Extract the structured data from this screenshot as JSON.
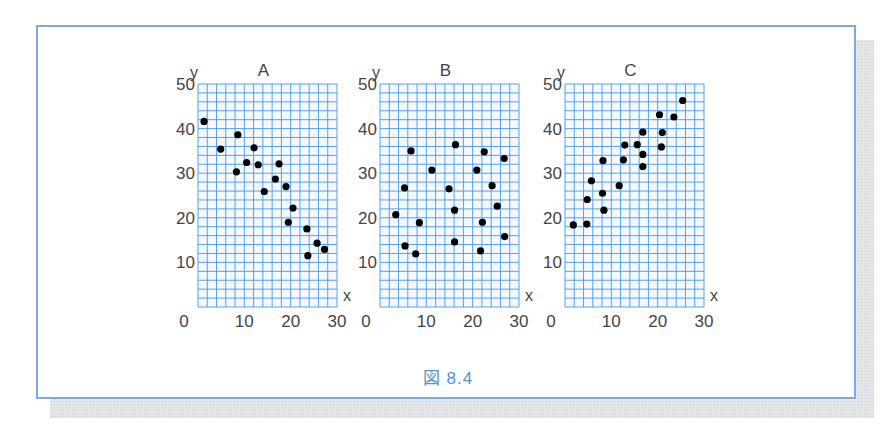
{
  "caption": "図 8.4",
  "colors": {
    "grid": "#5aa0e0",
    "frame": "#7fa9d8",
    "point": "#000000",
    "caption": "#5b8fcc"
  },
  "chart_data": [
    {
      "type": "scatter",
      "title": "A",
      "xlabel": "x",
      "ylabel": "y",
      "xlim": [
        0,
        30
      ],
      "ylim": [
        0,
        50
      ],
      "xticks": [
        0,
        10,
        20,
        30
      ],
      "yticks": [
        10,
        20,
        30,
        40,
        50
      ],
      "grid": true,
      "grid_step": 2,
      "points": [
        [
          1.3,
          41.6
        ],
        [
          4.9,
          35.4
        ],
        [
          8.6,
          38.6
        ],
        [
          8.3,
          30.3
        ],
        [
          10.5,
          32.4
        ],
        [
          12.1,
          35.7
        ],
        [
          13.0,
          31.9
        ],
        [
          14.3,
          25.9
        ],
        [
          16.7,
          28.7
        ],
        [
          17.5,
          32.1
        ],
        [
          19.0,
          27.0
        ],
        [
          20.5,
          22.2
        ],
        [
          19.5,
          19.0
        ],
        [
          23.5,
          17.5
        ],
        [
          25.7,
          14.3
        ],
        [
          27.3,
          12.9
        ],
        [
          23.7,
          11.5
        ]
      ]
    },
    {
      "type": "scatter",
      "title": "B",
      "xlabel": "x",
      "ylabel": "y",
      "xlim": [
        0,
        30
      ],
      "ylim": [
        0,
        50
      ],
      "xticks": [
        0,
        10,
        20,
        30
      ],
      "yticks": [
        10,
        20,
        30,
        40,
        50
      ],
      "grid": true,
      "grid_step": 2,
      "points": [
        [
          3.4,
          20.7
        ],
        [
          5.3,
          26.7
        ],
        [
          6.7,
          35.0
        ],
        [
          5.4,
          13.7
        ],
        [
          7.7,
          11.9
        ],
        [
          8.5,
          18.9
        ],
        [
          11.2,
          30.7
        ],
        [
          14.9,
          26.5
        ],
        [
          16.3,
          36.4
        ],
        [
          16.1,
          21.7
        ],
        [
          16.1,
          14.6
        ],
        [
          20.9,
          30.7
        ],
        [
          22.5,
          34.8
        ],
        [
          22.1,
          19.0
        ],
        [
          21.7,
          12.6
        ],
        [
          24.2,
          27.2
        ],
        [
          25.3,
          22.6
        ],
        [
          26.8,
          33.3
        ],
        [
          26.9,
          15.8
        ]
      ]
    },
    {
      "type": "scatter",
      "title": "C",
      "xlabel": "x",
      "ylabel": "y",
      "xlim": [
        0,
        30
      ],
      "ylim": [
        0,
        50
      ],
      "xticks": [
        0,
        10,
        20,
        30
      ],
      "yticks": [
        10,
        20,
        30,
        40,
        50
      ],
      "grid": true,
      "grid_step": 2,
      "points": [
        [
          1.8,
          18.4
        ],
        [
          4.7,
          18.6
        ],
        [
          4.8,
          24.1
        ],
        [
          5.7,
          28.3
        ],
        [
          8.2,
          32.8
        ],
        [
          8.1,
          25.5
        ],
        [
          8.4,
          21.7
        ],
        [
          11.7,
          27.2
        ],
        [
          12.6,
          33.0
        ],
        [
          12.9,
          36.3
        ],
        [
          15.6,
          36.4
        ],
        [
          16.8,
          39.2
        ],
        [
          16.8,
          34.2
        ],
        [
          16.8,
          31.5
        ],
        [
          20.4,
          43.1
        ],
        [
          21.0,
          39.1
        ],
        [
          20.8,
          35.9
        ],
        [
          23.5,
          42.6
        ],
        [
          25.4,
          46.3
        ]
      ]
    }
  ]
}
